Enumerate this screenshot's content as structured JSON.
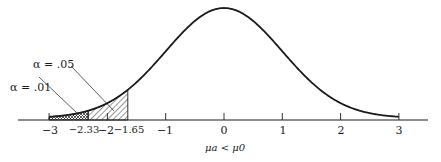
{
  "chart_data": {
    "type": "area",
    "title": "",
    "subtitle": "",
    "xlabel": "μa < μ0",
    "ylabel": "",
    "x_range": [
      -3,
      3
    ],
    "grid": false,
    "legend": null,
    "tick_labels": [
      "−3",
      "−2.33",
      "−2",
      "−1.65",
      "−1",
      "0",
      "1",
      "2",
      "3"
    ],
    "tick_values": [
      -3,
      -2.33,
      -2,
      -1.65,
      -1,
      0,
      1,
      2,
      3
    ],
    "curve": "normal(0,1) pdf",
    "regions": [
      {
        "label": "α = .01",
        "x_from": -3,
        "x_to": -2.33,
        "fill": "cross-hatch"
      },
      {
        "label": "α = .05",
        "x_from": -2.33,
        "x_to": -1.65,
        "fill": "diagonal-hatch"
      }
    ],
    "annotations": [
      "α = .01",
      "α = .05"
    ]
  },
  "labels": {
    "alpha_01": "α = .01",
    "alpha_05": "α = .05",
    "caption": "μa < μ0",
    "ticks": [
      "−3",
      "−2.33",
      "−2",
      "−1.65",
      "−1",
      "0",
      "1",
      "2",
      "3"
    ]
  },
  "colors": {
    "ink": "#1a1a1a",
    "background": "#ffffff"
  }
}
